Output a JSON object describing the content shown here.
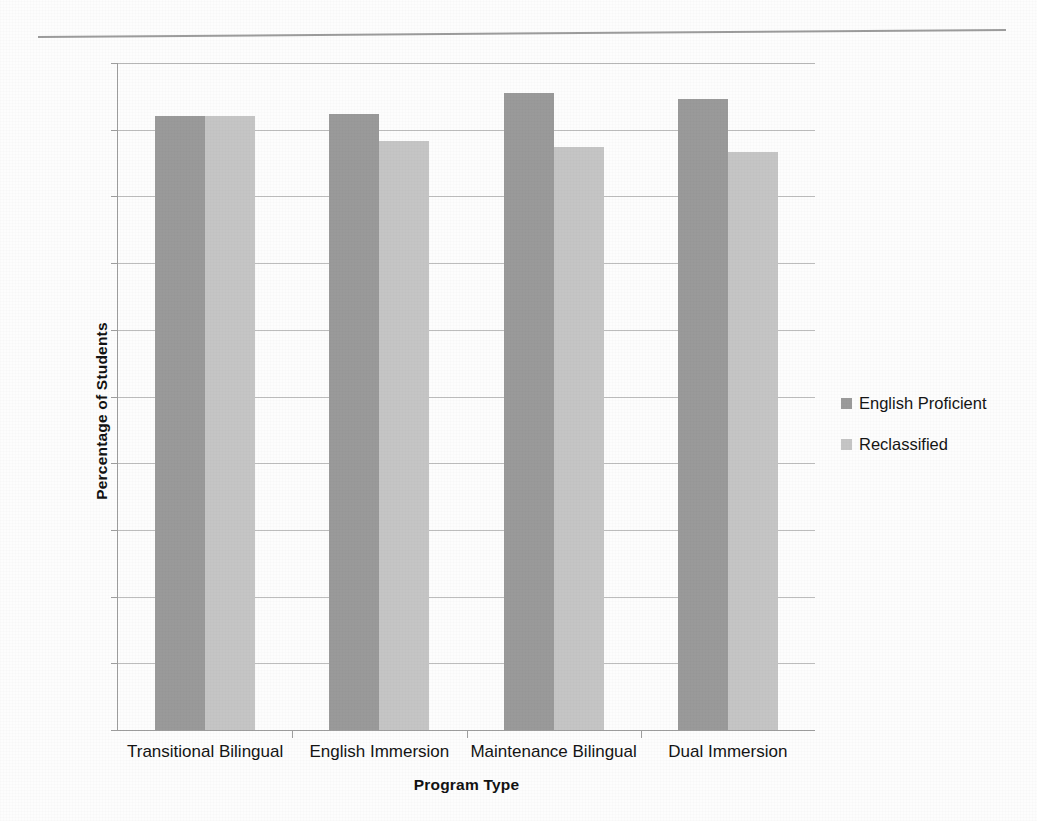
{
  "chart_data": {
    "type": "bar",
    "title": "",
    "xlabel": "Program Type",
    "ylabel": "Percentage of Students",
    "categories": [
      "Transitional Bilingual",
      "English Immersion",
      "Maintenance Bilingual",
      "Dual Immersion"
    ],
    "series": [
      {
        "name": "English Proficient",
        "color": "#9a9a9a",
        "values": [
          92.0,
          92.3,
          95.5,
          94.6
        ]
      },
      {
        "name": "Reclassified",
        "color": "#c5c5c5",
        "values": [
          92.0,
          88.3,
          87.4,
          86.7
        ]
      }
    ],
    "ylim": [
      0,
      100
    ],
    "ytick_values": [
      0,
      10,
      20,
      30,
      40,
      50,
      60,
      70,
      80,
      90,
      100
    ],
    "ytick_labels": [
      "0%",
      "10%",
      "20%",
      "30%",
      "40%",
      "50%",
      "60%",
      "70%",
      "80%",
      "90%",
      "100%"
    ],
    "grid": true,
    "grid_axis": "y",
    "legend_position": "right",
    "legend_entries": [
      "English Proficient",
      "Reclassified"
    ]
  },
  "page": {
    "background_color": "#fdfdfd",
    "rule_color": "#8b8b8b"
  }
}
